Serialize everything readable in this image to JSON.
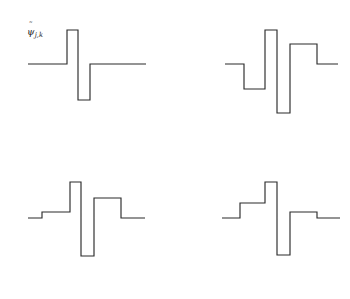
{
  "figure": {
    "background_color": "#ffffff",
    "line_color": "#2b2b2b",
    "width": 350,
    "height": 299,
    "layout": "2x2 grid of step-function wavelet plots"
  },
  "panels": [
    {
      "id": "panel-top-left",
      "position": "top-left",
      "label": {
        "base": "ψ",
        "accent": "˜",
        "subscript": "j,k",
        "text": "ψ̃ j,k"
      },
      "baseline_y": 64,
      "polyline": "28,64 67,64 67,30 78,30 78,100 90,100 90,64 146,64"
    },
    {
      "id": "panel-top-right",
      "position": "top-right",
      "label": {
        "variable": "μ",
        "relation": "=",
        "value": "0",
        "text": "μ = 0"
      },
      "baseline_y": 64,
      "polyline": "225,64 244,64 244,89 265,89 265,30 277,30 277,113 290,113 290,44 317,44 317,64 338,64"
    },
    {
      "id": "panel-bottom-left",
      "position": "bottom-left",
      "label": {
        "variable": "μ",
        "relation": "=",
        "value": "-1",
        "text": "μ = −1"
      },
      "baseline_y": 218,
      "polyline": "28,218 42,218 42,212 70,212 70,182 81,182 81,256 94,256 94,198 121,198 121,218 145,218"
    },
    {
      "id": "panel-bottom-right",
      "position": "bottom-right",
      "label": {
        "variable": "μ",
        "relation": "=",
        "value": "1",
        "text": "μ = 1"
      },
      "baseline_y": 218,
      "polyline": "222,218 240,218 240,203 265,203 265,182 277,182 277,255 290,255 290,212 317,212 317,218 340,218"
    }
  ],
  "chart_data": {
    "type": "line",
    "title": "",
    "subtitle": "",
    "xlabel": "",
    "ylabel": "",
    "grid": false,
    "legend": "none",
    "series": [
      {
        "name": "ψ̃ j,k",
        "panel": "top-left",
        "steps": [
          {
            "x_start": 0.0,
            "x_end": 0.34,
            "y": 0.0
          },
          {
            "x_start": 0.34,
            "x_end": 0.43,
            "y": 1.0
          },
          {
            "x_start": 0.43,
            "x_end": 0.53,
            "y": -1.0
          },
          {
            "x_start": 0.53,
            "x_end": 1.0,
            "y": 0.0
          }
        ]
      },
      {
        "name": "μ = 0",
        "panel": "top-right",
        "steps": [
          {
            "x_start": 0.0,
            "x_end": 0.17,
            "y": 0.0
          },
          {
            "x_start": 0.17,
            "x_end": 0.35,
            "y": -0.3
          },
          {
            "x_start": 0.35,
            "x_end": 0.46,
            "y": 1.0
          },
          {
            "x_start": 0.46,
            "x_end": 0.58,
            "y": -0.6
          },
          {
            "x_start": 0.58,
            "x_end": 0.81,
            "y": 0.4
          },
          {
            "x_start": 0.81,
            "x_end": 1.0,
            "y": 0.0
          }
        ]
      },
      {
        "name": "μ = −1",
        "panel": "bottom-left",
        "steps": [
          {
            "x_start": 0.0,
            "x_end": 0.12,
            "y": 0.0
          },
          {
            "x_start": 0.12,
            "x_end": 0.36,
            "y": 0.08
          },
          {
            "x_start": 0.36,
            "x_end": 0.45,
            "y": 0.48
          },
          {
            "x_start": 0.45,
            "x_end": 0.56,
            "y": -0.5
          },
          {
            "x_start": 0.56,
            "x_end": 0.79,
            "y": 0.27
          },
          {
            "x_start": 0.79,
            "x_end": 1.0,
            "y": 0.0
          }
        ]
      },
      {
        "name": "μ = 1",
        "panel": "bottom-right",
        "steps": [
          {
            "x_start": 0.0,
            "x_end": 0.15,
            "y": 0.0
          },
          {
            "x_start": 0.15,
            "x_end": 0.36,
            "y": 0.2
          },
          {
            "x_start": 0.36,
            "x_end": 0.47,
            "y": 0.48
          },
          {
            "x_start": 0.47,
            "x_end": 0.58,
            "y": -0.5
          },
          {
            "x_start": 0.58,
            "x_end": 0.81,
            "y": 0.08
          },
          {
            "x_start": 0.81,
            "x_end": 1.0,
            "y": 0.0
          }
        ]
      }
    ]
  }
}
